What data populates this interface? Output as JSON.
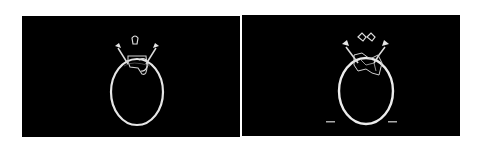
{
  "figure": {
    "panels": [
      {
        "id": "left",
        "description": "Axial CT slice of skull with segmented region outline"
      },
      {
        "id": "right",
        "description": "Axial CT slice of skull with segmentation contours and two scale markers"
      }
    ],
    "colors": {
      "background": "#000000",
      "bone": "#e8e8e8",
      "page": "#ffffff"
    }
  }
}
